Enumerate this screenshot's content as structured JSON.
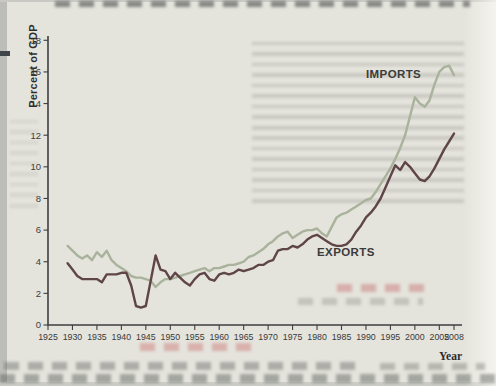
{
  "figure": {
    "ylabel": "Percent of GDP",
    "xlabel": "Year",
    "imports_label": "IMPORTS",
    "exports_label": "EXPORTS"
  },
  "colors": {
    "imports_line": "#a9b39c",
    "exports_line": "#5f4547",
    "axis": "#3f3f3f",
    "page_background": "#e4e3dc"
  },
  "chart_data": {
    "type": "line",
    "title": "",
    "ylabel": "Percent of GDP",
    "xlabel": "Year",
    "x_range": [
      1925,
      2008
    ],
    "y_range": [
      0,
      18
    ],
    "grid": false,
    "legend": "inline-labels",
    "y_ticks": [
      0,
      2,
      4,
      6,
      8,
      10,
      12,
      14,
      16,
      18
    ],
    "x_ticks": [
      1925,
      1930,
      1935,
      1940,
      1945,
      1950,
      1955,
      1960,
      1965,
      1970,
      1975,
      1980,
      1985,
      1990,
      1995,
      2000,
      2005,
      2008
    ],
    "years": [
      1929,
      1930,
      1931,
      1932,
      1933,
      1934,
      1935,
      1936,
      1937,
      1938,
      1939,
      1940,
      1941,
      1942,
      1943,
      1944,
      1945,
      1946,
      1947,
      1948,
      1949,
      1950,
      1951,
      1952,
      1953,
      1954,
      1955,
      1956,
      1957,
      1958,
      1959,
      1960,
      1961,
      1962,
      1963,
      1964,
      1965,
      1966,
      1967,
      1968,
      1969,
      1970,
      1971,
      1972,
      1973,
      1974,
      1975,
      1976,
      1977,
      1978,
      1979,
      1980,
      1981,
      1982,
      1983,
      1984,
      1985,
      1986,
      1987,
      1988,
      1989,
      1990,
      1991,
      1992,
      1993,
      1994,
      1995,
      1996,
      1997,
      1998,
      1999,
      2000,
      2001,
      2002,
      2003,
      2004,
      2005,
      2006,
      2007,
      2008
    ],
    "series": [
      {
        "name": "IMPORTS",
        "color": "#a9b39c",
        "values": [
          5.0,
          4.7,
          4.4,
          4.2,
          4.4,
          4.1,
          4.6,
          4.3,
          4.7,
          4.1,
          3.8,
          3.6,
          3.4,
          3.1,
          3.0,
          3.0,
          2.9,
          2.8,
          2.4,
          2.7,
          2.9,
          2.9,
          3.0,
          3.1,
          3.2,
          3.3,
          3.4,
          3.5,
          3.6,
          3.4,
          3.6,
          3.6,
          3.7,
          3.8,
          3.8,
          3.9,
          4.0,
          4.3,
          4.4,
          4.6,
          4.8,
          5.1,
          5.3,
          5.6,
          5.8,
          5.9,
          5.5,
          5.7,
          5.9,
          6.0,
          6.0,
          6.1,
          5.8,
          5.6,
          6.2,
          6.8,
          7.0,
          7.1,
          7.3,
          7.5,
          7.7,
          7.9,
          8.0,
          8.4,
          8.9,
          9.4,
          9.9,
          10.5,
          11.2,
          12.0,
          13.2,
          14.4,
          14.0,
          13.8,
          14.2,
          15.2,
          16.0,
          16.3,
          16.4,
          15.8
        ]
      },
      {
        "name": "EXPORTS",
        "color": "#5f4547",
        "values": [
          3.9,
          3.5,
          3.1,
          2.9,
          2.9,
          2.9,
          2.9,
          2.7,
          3.2,
          3.2,
          3.2,
          3.3,
          3.3,
          2.5,
          1.2,
          1.1,
          1.2,
          2.8,
          4.4,
          3.5,
          3.4,
          2.9,
          3.3,
          3.0,
          2.7,
          2.5,
          2.9,
          3.2,
          3.3,
          2.9,
          2.8,
          3.2,
          3.3,
          3.2,
          3.3,
          3.5,
          3.4,
          3.5,
          3.6,
          3.8,
          3.8,
          4.0,
          4.1,
          4.7,
          4.8,
          4.8,
          5.0,
          4.9,
          5.1,
          5.4,
          5.6,
          5.7,
          5.5,
          5.3,
          5.1,
          5.0,
          5.0,
          5.1,
          5.4,
          5.9,
          6.3,
          6.8,
          7.1,
          7.5,
          8.0,
          8.7,
          9.4,
          10.1,
          9.8,
          10.3,
          10.0,
          9.6,
          9.2,
          9.1,
          9.4,
          9.9,
          10.5,
          11.1,
          11.6,
          12.1
        ]
      }
    ]
  }
}
